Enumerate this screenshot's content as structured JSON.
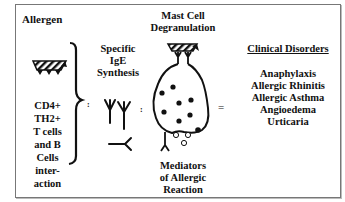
{
  "diagram": {
    "allergen": {
      "title": "Allergen",
      "cell_interaction": [
        "CD4+",
        "TH2+",
        "T cells",
        "and B",
        "Cells",
        "inter-",
        "action"
      ]
    },
    "ige": {
      "title": [
        "Specific",
        "IgE",
        "Synthesis"
      ]
    },
    "mast_cell": {
      "title": [
        "Mast Cell",
        "Degranulation"
      ],
      "mediators": [
        "Mediators",
        "of Allergic",
        "Reaction"
      ]
    },
    "operators": {
      "colon1": ":",
      "colon2": ":",
      "equals": "="
    },
    "clinical": {
      "title": "Clinical Disorders",
      "items": [
        "Anaphylaxis",
        "Allergic Rhinitis",
        "Allergic Asthma",
        "Angioedema",
        "Urticaria"
      ]
    },
    "colors": {
      "ink": "#111111",
      "border": "#777777",
      "background": "#ffffff"
    }
  }
}
